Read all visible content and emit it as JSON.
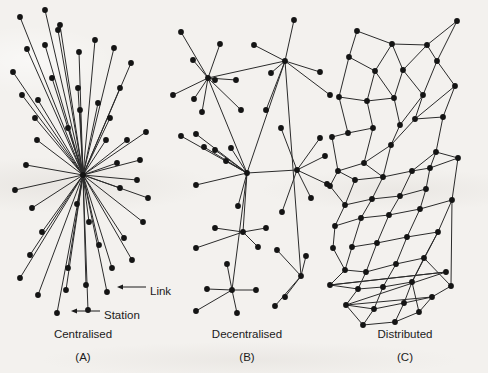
{
  "figure": {
    "background_color": "#f3f1ee",
    "node_color": "#141414",
    "edge_color": "#2b2b2b",
    "text_color": "#1b1b1b",
    "node_radius": 2.9,
    "width": 488,
    "height": 373
  },
  "annotations": {
    "link": {
      "label": "Link",
      "text_x": 150,
      "text_y": 291,
      "arrow_from_x": 146,
      "arrow_from_y": 287,
      "arrow_to_x": 117,
      "arrow_to_y": 287
    },
    "station": {
      "label": "Station",
      "text_x": 104,
      "text_y": 315,
      "arrow_from_x": 100,
      "arrow_from_y": 311,
      "arrow_to_x": 71,
      "arrow_to_y": 311
    }
  },
  "panels": [
    {
      "id": "centralised",
      "caption": "Centralised",
      "letter": "(A)",
      "caption_x": 83,
      "caption_y": 338,
      "letter_x": 83,
      "letter_y": 361,
      "hub": [
        83,
        175
      ],
      "nodes": [
        [
          20,
          17
        ],
        [
          45,
          10
        ],
        [
          60,
          25
        ],
        [
          27,
          49
        ],
        [
          13,
          72
        ],
        [
          22,
          95
        ],
        [
          35,
          118
        ],
        [
          45,
          45
        ],
        [
          58,
          30
        ],
        [
          37,
          140
        ],
        [
          26,
          165
        ],
        [
          15,
          190
        ],
        [
          32,
          208
        ],
        [
          42,
          232
        ],
        [
          30,
          255
        ],
        [
          20,
          278
        ],
        [
          38,
          295
        ],
        [
          57,
          313
        ],
        [
          66,
          290
        ],
        [
          68,
          268
        ],
        [
          86,
          285
        ],
        [
          88,
          310
        ],
        [
          107,
          292
        ],
        [
          112,
          268
        ],
        [
          99,
          245
        ],
        [
          89,
          222
        ],
        [
          77,
          204
        ],
        [
          124,
          238
        ],
        [
          132,
          260
        ],
        [
          143,
          222
        ],
        [
          148,
          198
        ],
        [
          137,
          180
        ],
        [
          120,
          188
        ],
        [
          117,
          163
        ],
        [
          140,
          160
        ],
        [
          127,
          140
        ],
        [
          146,
          132
        ],
        [
          106,
          140
        ],
        [
          110,
          118
        ],
        [
          98,
          103
        ],
        [
          120,
          88
        ],
        [
          131,
          63
        ],
        [
          114,
          48
        ],
        [
          95,
          40
        ],
        [
          79,
          52
        ],
        [
          78,
          88
        ],
        [
          80,
          110
        ],
        [
          68,
          128
        ],
        [
          52,
          78
        ],
        [
          38,
          100
        ]
      ]
    },
    {
      "id": "decentralised",
      "caption": "Decentralised",
      "letter": "(B)",
      "caption_x": 247,
      "caption_y": 338,
      "letter_x": 247,
      "letter_y": 361,
      "hubs": [
        [
          208,
          78
        ],
        [
          285,
          61
        ],
        [
          247,
          173
        ],
        [
          297,
          170
        ],
        [
          243,
          232
        ],
        [
          301,
          276
        ],
        [
          232,
          290
        ]
      ],
      "leaves": [
        [
          181,
          32
        ],
        [
          220,
          44
        ],
        [
          193,
          60
        ],
        [
          173,
          95
        ],
        [
          194,
          99
        ],
        [
          215,
          80
        ],
        [
          236,
          80
        ],
        [
          202,
          112
        ],
        [
          241,
          110
        ],
        [
          294,
          20
        ],
        [
          254,
          45
        ],
        [
          271,
          73
        ],
        [
          320,
          72
        ],
        [
          330,
          95
        ],
        [
          266,
          110
        ],
        [
          196,
          134
        ],
        [
          181,
          136
        ],
        [
          204,
          147
        ],
        [
          215,
          150
        ],
        [
          231,
          148
        ],
        [
          196,
          185
        ],
        [
          238,
          206
        ],
        [
          226,
          161
        ],
        [
          281,
          128
        ],
        [
          320,
          138
        ],
        [
          325,
          156
        ],
        [
          327,
          184
        ],
        [
          311,
          198
        ],
        [
          282,
          212
        ],
        [
          215,
          228
        ],
        [
          266,
          228
        ],
        [
          196,
          248
        ],
        [
          258,
          247
        ],
        [
          227,
          264
        ],
        [
          207,
          289
        ],
        [
          256,
          290
        ],
        [
          196,
          311
        ],
        [
          237,
          313
        ],
        [
          277,
          250
        ],
        [
          285,
          297
        ],
        [
          306,
          256
        ],
        [
          275,
          306
        ]
      ],
      "edges": [
        [
          0,
          "l0"
        ],
        [
          0,
          "l1"
        ],
        [
          0,
          "l2"
        ],
        [
          0,
          "l3"
        ],
        [
          0,
          "l4"
        ],
        [
          0,
          "l5"
        ],
        [
          0,
          "l6"
        ],
        [
          0,
          "l7"
        ],
        [
          0,
          "l8"
        ],
        [
          1,
          "l9"
        ],
        [
          1,
          "l10"
        ],
        [
          1,
          "l11"
        ],
        [
          1,
          "l12"
        ],
        [
          1,
          "l13"
        ],
        [
          1,
          "l14"
        ],
        [
          0,
          1
        ],
        [
          2,
          "l15"
        ],
        [
          2,
          "l16"
        ],
        [
          2,
          "l17"
        ],
        [
          2,
          "l18"
        ],
        [
          2,
          "l19"
        ],
        [
          2,
          "l20"
        ],
        [
          2,
          "l21"
        ],
        [
          2,
          "l22"
        ],
        [
          2,
          0
        ],
        [
          2,
          1
        ],
        [
          3,
          "l23"
        ],
        [
          3,
          "l24"
        ],
        [
          3,
          "l25"
        ],
        [
          3,
          "l26"
        ],
        [
          3,
          "l27"
        ],
        [
          3,
          "l28"
        ],
        [
          2,
          3
        ],
        [
          4,
          "l29"
        ],
        [
          4,
          "l30"
        ],
        [
          4,
          "l31"
        ],
        [
          4,
          "l32"
        ],
        [
          2,
          4
        ],
        [
          6,
          "l33"
        ],
        [
          6,
          "l34"
        ],
        [
          6,
          "l35"
        ],
        [
          6,
          "l36"
        ],
        [
          6,
          "l37"
        ],
        [
          2,
          6
        ],
        [
          5,
          "l38"
        ],
        [
          5,
          "l39"
        ],
        [
          5,
          "l40"
        ],
        [
          5,
          "l41"
        ],
        [
          1,
          5
        ]
      ]
    },
    {
      "id": "distributed",
      "caption": "Distributed",
      "letter": "(C)",
      "caption_x": 405,
      "caption_y": 338,
      "letter_x": 405,
      "letter_y": 361,
      "nodes": [
        [
          357,
          31
        ],
        [
          392,
          44
        ],
        [
          427,
          45
        ],
        [
          457,
          21
        ],
        [
          349,
          57
        ],
        [
          375,
          71
        ],
        [
          403,
          70
        ],
        [
          437,
          61
        ],
        [
          339,
          97
        ],
        [
          367,
          101
        ],
        [
          394,
          98
        ],
        [
          423,
          95
        ],
        [
          455,
          86
        ],
        [
          348,
          133
        ],
        [
          373,
          128
        ],
        [
          400,
          125
        ],
        [
          415,
          119
        ],
        [
          443,
          117
        ],
        [
          332,
          137
        ],
        [
          338,
          171
        ],
        [
          364,
          163
        ],
        [
          391,
          145
        ],
        [
          436,
          152
        ],
        [
          355,
          180
        ],
        [
          383,
          177
        ],
        [
          412,
          171
        ],
        [
          430,
          168
        ],
        [
          458,
          158
        ],
        [
          330,
          186
        ],
        [
          345,
          205
        ],
        [
          372,
          199
        ],
        [
          400,
          196
        ],
        [
          426,
          189
        ],
        [
          335,
          226
        ],
        [
          361,
          218
        ],
        [
          389,
          215
        ],
        [
          420,
          209
        ],
        [
          452,
          200
        ],
        [
          352,
          247
        ],
        [
          377,
          243
        ],
        [
          407,
          237
        ],
        [
          438,
          232
        ],
        [
          333,
          248
        ],
        [
          345,
          270
        ],
        [
          366,
          272
        ],
        [
          396,
          264
        ],
        [
          424,
          258
        ],
        [
          330,
          285
        ],
        [
          358,
          289
        ],
        [
          383,
          287
        ],
        [
          412,
          282
        ],
        [
          446,
          272
        ],
        [
          346,
          305
        ],
        [
          374,
          309
        ],
        [
          404,
          303
        ],
        [
          432,
          297
        ],
        [
          363,
          325
        ],
        [
          395,
          322
        ],
        [
          419,
          312
        ],
        [
          451,
          286
        ]
      ],
      "edges": [
        [
          0,
          1
        ],
        [
          1,
          2
        ],
        [
          2,
          3
        ],
        [
          0,
          4
        ],
        [
          1,
          5
        ],
        [
          1,
          6
        ],
        [
          2,
          6
        ],
        [
          2,
          7
        ],
        [
          3,
          7
        ],
        [
          4,
          5
        ],
        [
          4,
          8
        ],
        [
          5,
          9
        ],
        [
          5,
          10
        ],
        [
          6,
          10
        ],
        [
          6,
          11
        ],
        [
          7,
          11
        ],
        [
          7,
          12
        ],
        [
          8,
          9
        ],
        [
          8,
          13
        ],
        [
          9,
          14
        ],
        [
          9,
          10
        ],
        [
          10,
          15
        ],
        [
          11,
          15
        ],
        [
          11,
          16
        ],
        [
          12,
          17
        ],
        [
          12,
          16
        ],
        [
          13,
          14
        ],
        [
          13,
          18
        ],
        [
          14,
          20
        ],
        [
          15,
          21
        ],
        [
          16,
          21
        ],
        [
          16,
          17
        ],
        [
          17,
          22
        ],
        [
          18,
          19
        ],
        [
          19,
          20
        ],
        [
          19,
          23
        ],
        [
          20,
          21
        ],
        [
          20,
          24
        ],
        [
          21,
          24
        ],
        [
          22,
          25
        ],
        [
          22,
          26
        ],
        [
          22,
          27
        ],
        [
          23,
          24
        ],
        [
          23,
          29
        ],
        [
          24,
          25
        ],
        [
          24,
          30
        ],
        [
          25,
          26
        ],
        [
          25,
          31
        ],
        [
          26,
          27
        ],
        [
          26,
          32
        ],
        [
          28,
          29
        ],
        [
          28,
          19
        ],
        [
          29,
          30
        ],
        [
          29,
          33
        ],
        [
          30,
          31
        ],
        [
          30,
          34
        ],
        [
          31,
          32
        ],
        [
          31,
          35
        ],
        [
          32,
          36
        ],
        [
          27,
          37
        ],
        [
          33,
          34
        ],
        [
          33,
          42
        ],
        [
          34,
          35
        ],
        [
          34,
          38
        ],
        [
          35,
          36
        ],
        [
          35,
          39
        ],
        [
          36,
          37
        ],
        [
          36,
          40
        ],
        [
          37,
          41
        ],
        [
          38,
          39
        ],
        [
          38,
          43
        ],
        [
          39,
          40
        ],
        [
          39,
          44
        ],
        [
          40,
          41
        ],
        [
          40,
          45
        ],
        [
          41,
          46
        ],
        [
          41,
          50
        ],
        [
          42,
          43
        ],
        [
          43,
          44
        ],
        [
          43,
          47
        ],
        [
          44,
          45
        ],
        [
          44,
          48
        ],
        [
          45,
          46
        ],
        [
          45,
          49
        ],
        [
          46,
          50
        ],
        [
          47,
          48
        ],
        [
          47,
          51
        ],
        [
          48,
          49
        ],
        [
          48,
          52
        ],
        [
          49,
          50
        ],
        [
          49,
          53
        ],
        [
          50,
          54
        ],
        [
          50,
          58
        ],
        [
          51,
          52
        ],
        [
          52,
          53
        ],
        [
          52,
          55
        ],
        [
          53,
          54
        ],
        [
          53,
          56
        ],
        [
          54,
          55
        ],
        [
          54,
          57
        ],
        [
          55,
          58
        ],
        [
          55,
          59
        ],
        [
          56,
          57
        ],
        [
          57,
          58
        ],
        [
          37,
          59
        ],
        [
          46,
          59
        ],
        [
          51,
          47
        ],
        [
          56,
          52
        ]
      ]
    }
  ]
}
